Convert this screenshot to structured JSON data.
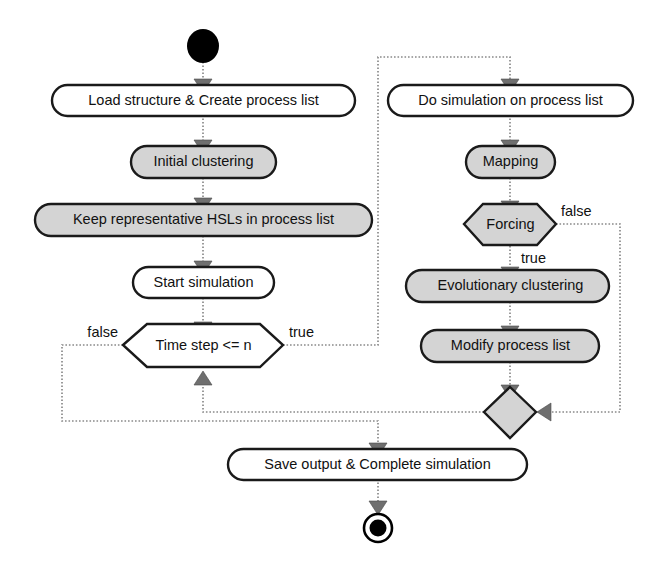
{
  "diagram": {
    "type": "uml-activity-diagram",
    "colors": {
      "node_fill_white": "#ffffff",
      "node_fill_gray": "#d4d4d4",
      "node_stroke": "#1a1a1a",
      "flow_line": "#8a8a8a",
      "text": "#111111",
      "background": "#ffffff"
    },
    "nodes": {
      "start": {
        "kind": "initial-node",
        "label": ""
      },
      "load_structure": {
        "kind": "action",
        "fill": "white",
        "label": "Load structure & Create process list"
      },
      "initial_clustering": {
        "kind": "action",
        "fill": "gray",
        "label": "Initial clustering"
      },
      "keep_hsls": {
        "kind": "action",
        "fill": "gray",
        "label": "Keep representative HSLs in process list"
      },
      "start_simulation": {
        "kind": "action",
        "fill": "white",
        "label": "Start simulation"
      },
      "time_step_decision": {
        "kind": "decision",
        "fill": "white",
        "label": "Time step <= n"
      },
      "do_simulation": {
        "kind": "action",
        "fill": "white",
        "label": "Do simulation on process list"
      },
      "mapping": {
        "kind": "action",
        "fill": "gray",
        "label": "Mapping"
      },
      "forcing_decision": {
        "kind": "decision",
        "fill": "gray",
        "label": "Forcing"
      },
      "evolutionary_clustering": {
        "kind": "action",
        "fill": "gray",
        "label": "Evolutionary clustering"
      },
      "modify_process_list": {
        "kind": "action",
        "fill": "gray",
        "label": "Modify process list"
      },
      "merge": {
        "kind": "merge-node",
        "fill": "gray",
        "label": ""
      },
      "save_output": {
        "kind": "action",
        "fill": "white",
        "label": "Save output & Complete simulation"
      },
      "end": {
        "kind": "final-node",
        "label": ""
      }
    },
    "guards": {
      "time_step_false": "false",
      "time_step_true": "true",
      "forcing_false": "false",
      "forcing_true": "true"
    },
    "edges": [
      {
        "from": "start",
        "to": "load_structure",
        "guard": ""
      },
      {
        "from": "load_structure",
        "to": "initial_clustering",
        "guard": ""
      },
      {
        "from": "initial_clustering",
        "to": "keep_hsls",
        "guard": ""
      },
      {
        "from": "keep_hsls",
        "to": "start_simulation",
        "guard": ""
      },
      {
        "from": "start_simulation",
        "to": "time_step_decision",
        "guard": ""
      },
      {
        "from": "time_step_decision",
        "to": "do_simulation",
        "guard": "true"
      },
      {
        "from": "time_step_decision",
        "to": "save_output",
        "guard": "false"
      },
      {
        "from": "do_simulation",
        "to": "mapping",
        "guard": ""
      },
      {
        "from": "mapping",
        "to": "forcing_decision",
        "guard": ""
      },
      {
        "from": "forcing_decision",
        "to": "evolutionary_clustering",
        "guard": "true"
      },
      {
        "from": "forcing_decision",
        "to": "merge",
        "guard": "false"
      },
      {
        "from": "evolutionary_clustering",
        "to": "modify_process_list",
        "guard": ""
      },
      {
        "from": "modify_process_list",
        "to": "merge",
        "guard": ""
      },
      {
        "from": "merge",
        "to": "time_step_decision",
        "guard": ""
      },
      {
        "from": "save_output",
        "to": "end",
        "guard": ""
      }
    ]
  }
}
